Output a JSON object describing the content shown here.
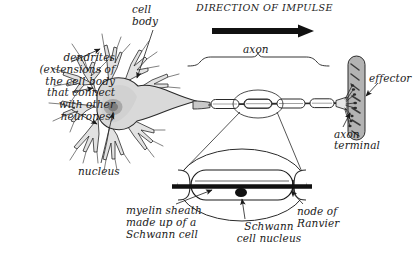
{
  "figure": {
    "background_color": "#ffffff",
    "ink_color": "#1a1a1a"
  },
  "labels": {
    "cell_body": "cell\nbody",
    "dendrites": "dendrites\n(extensions of\nthe cell body\nthat connect\nwith other\nneurones)",
    "nucleus": "nucleus",
    "direction_of_impulse": "DIRECTION OF IMPULSE",
    "axon": "axon",
    "effector": "effector",
    "axon_terminal": "axon\nterminal",
    "myelin_sheath": "myelin sheath\nmade up of a\nSchwann cell",
    "schwann_cell_nucleus": "Schwann\ncell nucleus",
    "node_of_ranvier": "node of\nRanvier"
  },
  "colors": {
    "soma_fill": "#d9d9d9",
    "soma_nucleus": "#8c8c8c",
    "effector_fill": "#b3b3b3",
    "outline": "#1a1a1a",
    "myelin_fill": "#ffffff",
    "axon_core": "#111111"
  },
  "parts": {
    "soma": "cell-body-soma",
    "dendrite_count": 9,
    "myelin_segments": 6,
    "nodes_of_ranvier": 5,
    "inset": "magnified-myelin-segment"
  }
}
